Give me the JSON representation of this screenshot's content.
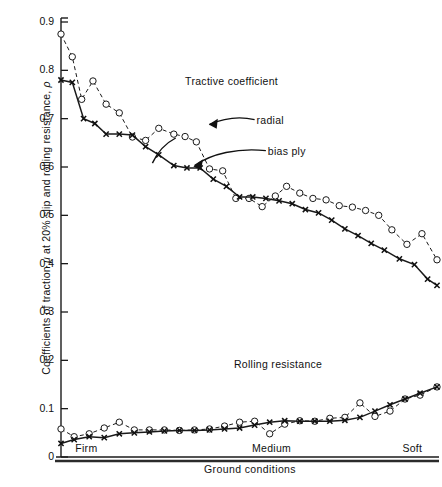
{
  "chart_data": {
    "type": "line",
    "title": "",
    "xlabel": "Ground conditions",
    "ylabel": "Coefficients of traction μ at 20% slip and rolling resistance, ρ",
    "ylim": [
      0,
      0.9
    ],
    "ytick_labels": [
      "0",
      "0.1",
      "0.2",
      "0.3",
      "0.4",
      "0.5",
      "0.6",
      "0.7",
      "0.8",
      "0.9"
    ],
    "ytick_values": [
      0,
      0.1,
      0.2,
      0.3,
      0.4,
      0.5,
      0.6,
      0.7,
      0.8,
      0.9
    ],
    "xtick_labels": [
      "Firm",
      "Medium",
      "Soft"
    ],
    "xtick_positions": [
      0.03,
      0.5,
      0.9
    ],
    "grid": false,
    "legend_position": "inline-annotations",
    "annotations": [
      {
        "text": "Tractive coefficient",
        "x": 0.33,
        "y": 0.775
      },
      {
        "text": "radial",
        "x": 0.52,
        "y": 0.695
      },
      {
        "text": "bias ply",
        "x": 0.55,
        "y": 0.632
      },
      {
        "text": "Rolling resistance",
        "x": 0.46,
        "y": 0.19
      }
    ],
    "groups": [
      {
        "name": "Tractive coefficient",
        "series": [
          {
            "name": "radial",
            "style": "dashed-open-circle",
            "x": [
              0.0,
              0.03,
              0.055,
              0.085,
              0.12,
              0.155,
              0.19,
              0.225,
              0.26,
              0.3,
              0.33,
              0.36,
              0.395,
              0.43,
              0.465,
              0.5,
              0.535,
              0.57,
              0.6,
              0.635,
              0.67,
              0.705,
              0.74,
              0.775,
              0.81,
              0.845,
              0.88,
              0.92,
              0.96,
              1.0
            ],
            "y": [
              0.875,
              0.828,
              0.74,
              0.778,
              0.73,
              0.712,
              0.662,
              0.655,
              0.68,
              0.668,
              0.663,
              0.652,
              0.596,
              0.592,
              0.535,
              0.535,
              0.518,
              0.54,
              0.56,
              0.546,
              0.535,
              0.532,
              0.52,
              0.517,
              0.51,
              0.5,
              0.47,
              0.44,
              0.462,
              0.408
            ]
          },
          {
            "name": "bias ply",
            "style": "solid-cross",
            "x": [
              0.0,
              0.03,
              0.06,
              0.09,
              0.12,
              0.155,
              0.19,
              0.225,
              0.26,
              0.3,
              0.335,
              0.37,
              0.405,
              0.44,
              0.475,
              0.51,
              0.545,
              0.58,
              0.615,
              0.65,
              0.685,
              0.72,
              0.755,
              0.79,
              0.825,
              0.86,
              0.9,
              0.94,
              0.975,
              1.0
            ],
            "y": [
              0.78,
              0.775,
              0.7,
              0.69,
              0.668,
              0.668,
              0.666,
              0.642,
              0.625,
              0.603,
              0.598,
              0.598,
              0.575,
              0.56,
              0.538,
              0.538,
              0.535,
              0.53,
              0.524,
              0.512,
              0.505,
              0.49,
              0.472,
              0.458,
              0.442,
              0.428,
              0.41,
              0.398,
              0.368,
              0.355
            ]
          }
        ]
      },
      {
        "name": "Rolling resistance",
        "series": [
          {
            "name": "radial",
            "style": "dashed-open-circle",
            "x": [
              0.0,
              0.035,
              0.075,
              0.115,
              0.155,
              0.195,
              0.235,
              0.275,
              0.315,
              0.355,
              0.395,
              0.435,
              0.475,
              0.515,
              0.555,
              0.595,
              0.635,
              0.675,
              0.715,
              0.755,
              0.795,
              0.835,
              0.875,
              0.915,
              0.955,
              1.0
            ],
            "y": [
              0.058,
              0.042,
              0.048,
              0.06,
              0.072,
              0.056,
              0.056,
              0.056,
              0.055,
              0.056,
              0.058,
              0.064,
              0.072,
              0.074,
              0.048,
              0.068,
              0.075,
              0.074,
              0.08,
              0.082,
              0.112,
              0.084,
              0.095,
              0.12,
              0.128,
              0.145
            ]
          },
          {
            "name": "bias ply",
            "style": "solid-cross",
            "x": [
              0.0,
              0.035,
              0.075,
              0.115,
              0.155,
              0.195,
              0.235,
              0.275,
              0.315,
              0.355,
              0.395,
              0.435,
              0.475,
              0.515,
              0.555,
              0.595,
              0.635,
              0.675,
              0.715,
              0.755,
              0.795,
              0.835,
              0.875,
              0.915,
              0.955,
              1.0
            ],
            "y": [
              0.028,
              0.036,
              0.042,
              0.04,
              0.048,
              0.05,
              0.052,
              0.054,
              0.055,
              0.055,
              0.056,
              0.058,
              0.06,
              0.066,
              0.072,
              0.075,
              0.074,
              0.074,
              0.074,
              0.076,
              0.082,
              0.095,
              0.108,
              0.12,
              0.132,
              0.145
            ]
          }
        ]
      }
    ]
  },
  "axes": {
    "y_title_pre": "Coefficients of traction ",
    "y_title_mu": "μ",
    "y_title_mid": " at 20% slip and rolling resistance, ",
    "y_title_rho": "ρ",
    "x_title": "Ground conditions"
  }
}
